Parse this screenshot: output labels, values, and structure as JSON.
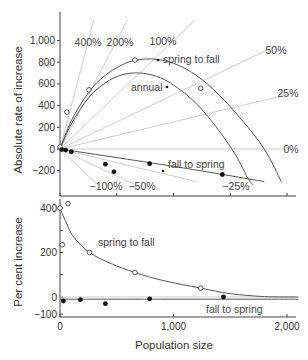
{
  "chart_data": [
    {
      "panel": "top",
      "type": "line",
      "ylabel": "Absolute rate of increase",
      "xlabel": "",
      "xlim": [
        0,
        2100
      ],
      "ylim": [
        -350,
        1200
      ],
      "yticks": [
        {
          "value": 1000,
          "label": "1,000"
        },
        {
          "value": 800,
          "label": "800"
        },
        {
          "value": 600,
          "label": "600"
        },
        {
          "value": 400,
          "label": "400"
        },
        {
          "value": 200,
          "label": "200"
        },
        {
          "value": 0,
          "label": "0"
        },
        {
          "value": -200,
          "label": "−200"
        }
      ],
      "xticks": [
        0,
        500,
        1000,
        1500,
        2000
      ],
      "reference_lines": [
        {
          "percent": 400,
          "label": "400%"
        },
        {
          "percent": 200,
          "label": "200%"
        },
        {
          "percent": 100,
          "label": "100%"
        },
        {
          "percent": 50,
          "label": "50%"
        },
        {
          "percent": 25,
          "label": "25%"
        },
        {
          "percent": 0,
          "label": "0%"
        },
        {
          "percent": -25,
          "label": "−25%"
        },
        {
          "percent": -50,
          "label": "−50%"
        },
        {
          "percent": -100,
          "label": "−100%"
        }
      ],
      "series": [
        {
          "name": "spring to fall",
          "marker": "open",
          "points": [
            [
              0,
              20
            ],
            [
              60,
              340
            ],
            [
              255,
              545
            ],
            [
              660,
              820
            ],
            [
              1240,
              560
            ]
          ],
          "curve": [
            [
              0,
              0
            ],
            [
              100,
              260
            ],
            [
              250,
              520
            ],
            [
              400,
              680
            ],
            [
              600,
              800
            ],
            [
              800,
              830
            ],
            [
              1000,
              790
            ],
            [
              1200,
              680
            ],
            [
              1400,
              500
            ],
            [
              1600,
              270
            ],
            [
              1800,
              0
            ],
            [
              1950,
              -300
            ]
          ]
        },
        {
          "name": "annual",
          "marker": "none",
          "points": [],
          "curve": [
            [
              0,
              0
            ],
            [
              100,
              230
            ],
            [
              250,
              470
            ],
            [
              400,
              610
            ],
            [
              550,
              685
            ],
            [
              700,
              700
            ],
            [
              850,
              670
            ],
            [
              1000,
              590
            ],
            [
              1200,
              420
            ],
            [
              1400,
              170
            ],
            [
              1550,
              -60
            ],
            [
              1650,
              -260
            ],
            [
              1700,
              -330
            ]
          ]
        },
        {
          "name": "fall to spring",
          "marker": "filled",
          "points": [
            [
              15,
              -5
            ],
            [
              50,
              -10
            ],
            [
              100,
              -25
            ],
            [
              400,
              -140
            ],
            [
              475,
              -210
            ],
            [
              790,
              -135
            ],
            [
              1430,
              -235
            ]
          ],
          "curve": [
            [
              0,
              0
            ],
            [
              1000,
              -160
            ],
            [
              1800,
              -300
            ]
          ]
        }
      ],
      "annotations": [
        "spring to fall",
        "annual",
        "fall to spring"
      ]
    },
    {
      "panel": "bottom",
      "type": "line",
      "ylabel": "Per cent increase",
      "xlabel": "Population size",
      "xlim": [
        0,
        2100
      ],
      "ylim": [
        -100,
        450
      ],
      "yticks": [
        {
          "value": 400,
          "label": "400"
        },
        {
          "value": 300,
          "label": ""
        },
        {
          "value": 200,
          "label": "200"
        },
        {
          "value": 100,
          "label": ""
        },
        {
          "value": 0,
          "label": "0"
        },
        {
          "value": -100,
          "label": "−100"
        }
      ],
      "xticks": [
        {
          "value": 0,
          "label": "0"
        },
        {
          "value": 1000,
          "label": "1,000"
        },
        {
          "value": 2000,
          "label": "2,000"
        }
      ],
      "series": [
        {
          "name": "spring to fall",
          "marker": "open",
          "points": [
            [
              0,
              400
            ],
            [
              70,
              420
            ],
            [
              20,
              235
            ],
            [
              260,
              200
            ],
            [
              660,
              110
            ],
            [
              1240,
              40
            ]
          ],
          "curve": [
            [
              0,
              400
            ],
            [
              50,
              340
            ],
            [
              120,
              270
            ],
            [
              260,
              200
            ],
            [
              450,
              150
            ],
            [
              660,
              110
            ],
            [
              900,
              75
            ],
            [
              1240,
              40
            ],
            [
              1500,
              15
            ],
            [
              1800,
              2
            ],
            [
              2100,
              0
            ]
          ]
        },
        {
          "name": "fall to spring",
          "marker": "filled",
          "points": [
            [
              30,
              -18
            ],
            [
              180,
              -12
            ],
            [
              400,
              -30
            ],
            [
              790,
              -8
            ],
            [
              1440,
              0
            ]
          ],
          "curve": [
            [
              0,
              -10
            ],
            [
              2100,
              -10
            ]
          ]
        }
      ],
      "zero_band": [
        0,
        -10
      ],
      "annotations": [
        "spring to fall",
        "fall to spring"
      ]
    }
  ]
}
